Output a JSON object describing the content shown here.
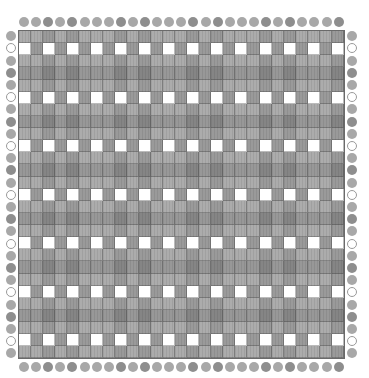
{
  "pattern": {
    "columns": 27,
    "rows": 26,
    "column_threads": [
      "L",
      "L",
      "D",
      "L",
      "D",
      "L",
      "L",
      "L",
      "D",
      "L",
      "D",
      "L",
      "L",
      "L",
      "D",
      "L",
      "D",
      "L",
      "L",
      "L",
      "D",
      "L",
      "D",
      "L",
      "L",
      "L",
      "D"
    ],
    "row_threads": [
      "L",
      "W",
      "L",
      "D",
      "L",
      "W",
      "L",
      "D",
      "L",
      "W",
      "L",
      "D",
      "L",
      "W",
      "L",
      "D",
      "L",
      "W",
      "L",
      "D",
      "L",
      "W",
      "L",
      "D",
      "L",
      "W"
    ],
    "row_threads_bottom_extra": "L"
  },
  "colors": {
    "background": "#ffffff",
    "L_bead": "#a8a8a8",
    "D_bead": "#8e8e8e",
    "W_bead": "#ffffff",
    "cell_LL": "#acacac",
    "cell_LD": "#9a9a9a",
    "cell_DL": "#989898",
    "cell_DD": "#858585",
    "cell_W_on_L": "#ffffff",
    "cell_W_on_D": "#8f8f8f",
    "cell_L_on_W": "#b4b4b4"
  },
  "layout": {
    "grid_left": 18,
    "grid_top": 30,
    "cell_w": 12.1,
    "cell_h": 12.2,
    "bead_size": 10
  }
}
